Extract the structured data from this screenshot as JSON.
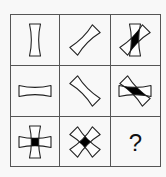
{
  "puzzle": {
    "type": "3x3 figure reasoning grid",
    "grid": {
      "x": 10,
      "y": 14,
      "width": 151,
      "height": 153,
      "rows": 3,
      "cols": 3,
      "line_color": "#555555",
      "background": "#f8f8f8"
    },
    "shape": {
      "name": "concave-bar",
      "stroke": "#222222",
      "intersection_fill": "#000000"
    },
    "cells": [
      {
        "row": 0,
        "col": 0,
        "bars": [
          0
        ],
        "filled_intersection": false
      },
      {
        "row": 0,
        "col": 1,
        "bars": [
          45
        ],
        "filled_intersection": false
      },
      {
        "row": 0,
        "col": 2,
        "bars": [
          0,
          45
        ],
        "filled_intersection": true
      },
      {
        "row": 1,
        "col": 0,
        "bars": [
          90
        ],
        "filled_intersection": false
      },
      {
        "row": 1,
        "col": 1,
        "bars": [
          -45
        ],
        "filled_intersection": false
      },
      {
        "row": 1,
        "col": 2,
        "bars": [
          90,
          -45
        ],
        "filled_intersection": true
      },
      {
        "row": 2,
        "col": 0,
        "bars": [
          0,
          90
        ],
        "filled_intersection": true
      },
      {
        "row": 2,
        "col": 1,
        "bars": [
          45,
          -45
        ],
        "filled_intersection": true
      },
      {
        "row": 2,
        "col": 2,
        "bars": [],
        "label": "?"
      }
    ],
    "question_mark": "?"
  }
}
